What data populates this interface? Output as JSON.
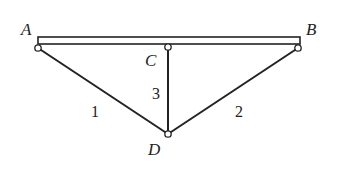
{
  "diagram": {
    "type": "truss-structure",
    "beam": {
      "from": "A",
      "to": "B"
    },
    "nodes": [
      {
        "id": "A",
        "label": "A"
      },
      {
        "id": "B",
        "label": "B"
      },
      {
        "id": "C",
        "label": "C"
      },
      {
        "id": "D",
        "label": "D"
      }
    ],
    "members": [
      {
        "id": "1",
        "label": "1",
        "from": "A",
        "to": "D"
      },
      {
        "id": "2",
        "label": "2",
        "from": "B",
        "to": "D"
      },
      {
        "id": "3",
        "label": "3",
        "from": "C",
        "to": "D"
      }
    ],
    "colors": {
      "ink": "#222222",
      "background": "#ffffff"
    }
  }
}
